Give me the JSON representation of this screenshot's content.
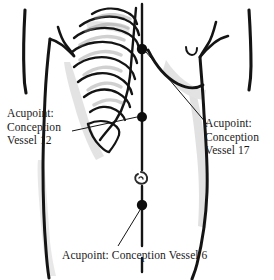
{
  "figure": {
    "background_color": "#ffffff",
    "ink_color": "#141414",
    "shading_color": "#b3b3b3",
    "width": 274,
    "height": 280
  },
  "labels": {
    "cv12": {
      "name": "acupoint-label-cv12",
      "line1": "Acupoint:",
      "line2": "Conception",
      "line3": "Vessel 12",
      "full_text": "Acupoint: Conception Vessel 12",
      "vessel_number": 12
    },
    "cv17": {
      "name": "acupoint-label-cv17",
      "line1": "Acupoint:",
      "line2": "Conception",
      "line3": "Vessel 17",
      "full_text": "Acupoint: Conception Vessel 17",
      "vessel_number": 17
    },
    "cv6": {
      "name": "acupoint-label-cv6",
      "line1": "Acupoint: Conception Vessel 6",
      "full_text": "Acupoint: Conception Vessel 6",
      "vessel_number": 6
    }
  },
  "acupoints": [
    {
      "id": "cv17",
      "label": "Conception Vessel 17",
      "x": 142,
      "y": 49,
      "radius": 5.2
    },
    {
      "id": "cv12",
      "label": "Conception Vessel 12",
      "x": 142,
      "y": 117,
      "radius": 5.0
    },
    {
      "id": "cv6",
      "label": "Conception Vessel 6",
      "x": 142,
      "y": 205,
      "radius": 5.2
    }
  ],
  "anatomy": {
    "midline_label": "conception-vessel-midline",
    "navel": {
      "x": 142,
      "y": 178
    },
    "ribs_count": 8,
    "parts": [
      "left-arm",
      "right-arm",
      "torso-outline",
      "ribcage",
      "right-breast",
      "navel",
      "conception-vessel-midline"
    ]
  },
  "leader_lines": [
    {
      "id": "leader-cv12",
      "from_x": 72,
      "from_y": 131,
      "to_x": 137,
      "to_y": 117
    },
    {
      "id": "leader-cv17",
      "from_x": 146,
      "from_y": 52,
      "to_x": 207,
      "to_y": 124
    },
    {
      "id": "leader-cv6",
      "from_x": 140,
      "from_y": 210,
      "to_x": 118,
      "to_y": 246
    }
  ]
}
